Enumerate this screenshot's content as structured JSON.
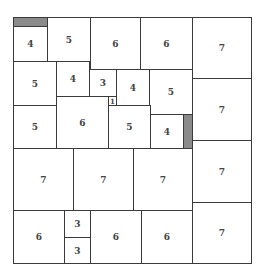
{
  "diagram": {
    "type": "square-packing",
    "colors": {
      "border": "#3a3a3a",
      "fill": "#ffffff",
      "shade": "#8a8a8a",
      "text": "#444444"
    },
    "cells": [
      {
        "label": "",
        "x": 13,
        "y": 17,
        "w": 34,
        "h": 9,
        "shade": true
      },
      {
        "label": "4",
        "x": 13,
        "y": 26,
        "w": 34,
        "h": 35
      },
      {
        "label": "5",
        "x": 47,
        "y": 17,
        "w": 43,
        "h": 44
      },
      {
        "label": "6",
        "x": 90,
        "y": 17,
        "w": 50,
        "h": 52
      },
      {
        "label": "6",
        "x": 140,
        "y": 17,
        "w": 52,
        "h": 52
      },
      {
        "label": "7",
        "x": 192,
        "y": 17,
        "w": 59,
        "h": 61
      },
      {
        "label": "5",
        "x": 13,
        "y": 61,
        "w": 43,
        "h": 44
      },
      {
        "label": "4",
        "x": 56,
        "y": 61,
        "w": 33,
        "h": 35
      },
      {
        "label": "3",
        "x": 89,
        "y": 69,
        "w": 27,
        "h": 27
      },
      {
        "label": "4",
        "x": 116,
        "y": 69,
        "w": 33,
        "h": 36
      },
      {
        "label": "5",
        "x": 149,
        "y": 69,
        "w": 43,
        "h": 45
      },
      {
        "label": "7",
        "x": 192,
        "y": 78,
        "w": 59,
        "h": 62
      },
      {
        "label": "5",
        "x": 13,
        "y": 105,
        "w": 43,
        "h": 43
      },
      {
        "label": "6",
        "x": 56,
        "y": 96,
        "w": 52,
        "h": 52
      },
      {
        "label": "1",
        "x": 108,
        "y": 96,
        "w": 8,
        "h": 9,
        "small": true
      },
      {
        "label": "5",
        "x": 108,
        "y": 105,
        "w": 42,
        "h": 43
      },
      {
        "label": "4",
        "x": 150,
        "y": 114,
        "w": 33,
        "h": 34
      },
      {
        "label": "",
        "x": 183,
        "y": 114,
        "w": 9,
        "h": 34,
        "shade": true
      },
      {
        "label": "7",
        "x": 13,
        "y": 148,
        "w": 60,
        "h": 62
      },
      {
        "label": "7",
        "x": 73,
        "y": 148,
        "w": 60,
        "h": 62
      },
      {
        "label": "7",
        "x": 133,
        "y": 148,
        "w": 59,
        "h": 62
      },
      {
        "label": "7",
        "x": 192,
        "y": 140,
        "w": 59,
        "h": 62
      },
      {
        "label": "6",
        "x": 13,
        "y": 210,
        "w": 51,
        "h": 53
      },
      {
        "label": "3",
        "x": 64,
        "y": 210,
        "w": 26,
        "h": 27
      },
      {
        "label": "3",
        "x": 64,
        "y": 237,
        "w": 26,
        "h": 26
      },
      {
        "label": "6",
        "x": 90,
        "y": 210,
        "w": 51,
        "h": 53
      },
      {
        "label": "6",
        "x": 141,
        "y": 210,
        "w": 51,
        "h": 53
      },
      {
        "label": "7",
        "x": 192,
        "y": 202,
        "w": 59,
        "h": 61
      }
    ]
  }
}
